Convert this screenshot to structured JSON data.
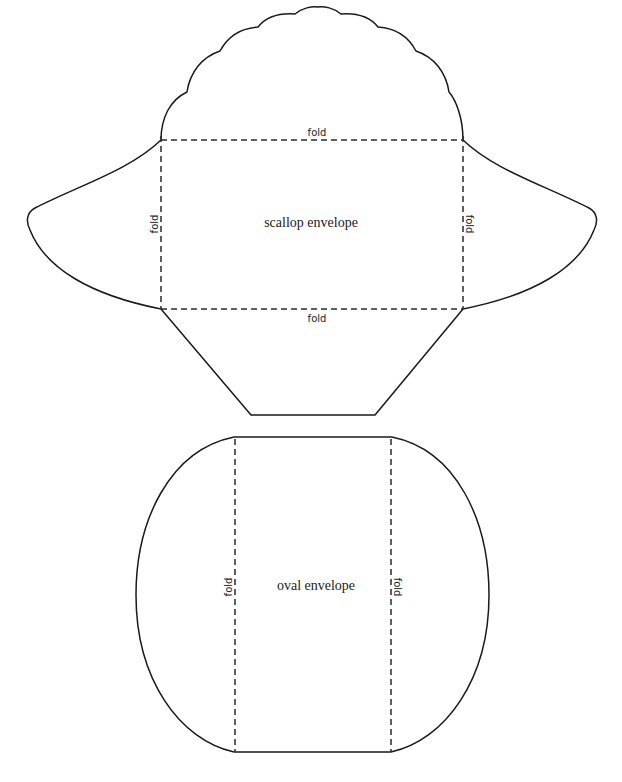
{
  "diagram": {
    "scallop": {
      "title": "scallop envelope",
      "fold_top": "fold",
      "fold_bottom": "fold",
      "fold_left": "fold",
      "fold_right": "fold"
    },
    "oval": {
      "title": "oval envelope",
      "fold_left": "fold",
      "fold_right": "fold"
    },
    "colors": {
      "line": "#1a1a1a",
      "background": "#ffffff"
    }
  }
}
